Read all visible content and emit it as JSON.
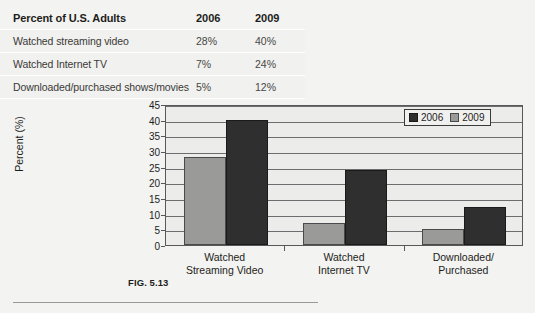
{
  "table": {
    "header": {
      "label": "Percent of U.S. Adults",
      "col1": "2006",
      "col2": "2009"
    },
    "rows": [
      {
        "label": "Watched streaming video",
        "col1": "28%",
        "col2": "40%"
      },
      {
        "label": "Watched Internet TV",
        "col1": "7%",
        "col2": "24%"
      },
      {
        "label": "Downloaded/purchased shows/movies",
        "col1": "5%",
        "col2": "12%"
      }
    ]
  },
  "caption": {
    "text": "FIG. 5.13"
  },
  "legend": {
    "items": [
      {
        "label": "2006",
        "color": "#2f2f2f"
      },
      {
        "label": "2009",
        "color": "#9a9a99"
      }
    ]
  },
  "chart_data": {
    "type": "bar",
    "title": "",
    "xlabel": "",
    "ylabel": "Percent (%)",
    "ylim": [
      0,
      45
    ],
    "ytick_step": 5,
    "yticks": [
      0,
      5,
      10,
      15,
      20,
      25,
      30,
      35,
      40,
      45
    ],
    "ytick_labels": [
      "0",
      "5",
      "10",
      "15",
      "20",
      "25",
      "30",
      "35",
      "40",
      "45"
    ],
    "grid": true,
    "legend_position": "top-right",
    "categories": [
      "Watched\nStreaming Video",
      "Watched\nInternet TV",
      "Downloaded/\nPurchased"
    ],
    "category_lines": [
      [
        "Watched",
        "Streaming Video"
      ],
      [
        "Watched",
        "Internet TV"
      ],
      [
        "Downloaded/",
        "Purchased"
      ]
    ],
    "series": [
      {
        "name": "2006",
        "color": "#9a9a99",
        "values": [
          28,
          7,
          5
        ]
      },
      {
        "name": "2009",
        "color": "#2f2f2f",
        "values": [
          40,
          24,
          12
        ]
      }
    ]
  }
}
